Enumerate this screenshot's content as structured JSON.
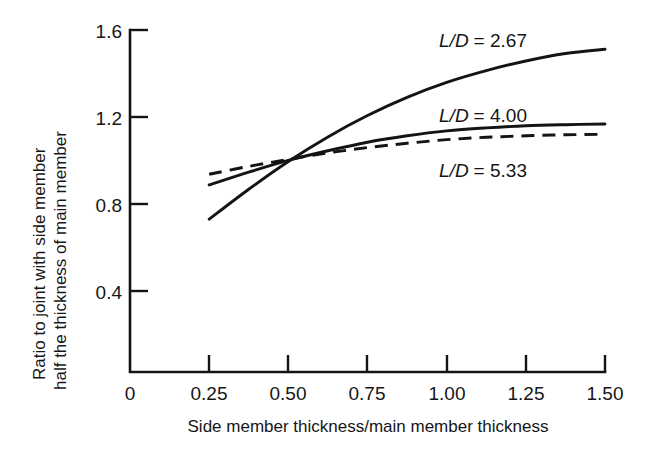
{
  "chart_data": {
    "type": "line",
    "title": "",
    "xlabel": "Side member thickness/main member thickness",
    "ylabel_line1": "Ratio to joint with side member",
    "ylabel_line2": "half the thickness of main member",
    "xlim": [
      0,
      1.5
    ],
    "ylim": [
      0,
      1.6
    ],
    "grid": false,
    "legend_position": "inline-right",
    "xticks": [
      0,
      0.25,
      0.5,
      0.75,
      1.0,
      1.25,
      1.5
    ],
    "xtick_labels": [
      "0",
      "0.25",
      "0.50",
      "0.75",
      "1.00",
      "1.25",
      "1.50"
    ],
    "yticks": [
      0.4,
      0.8,
      1.2,
      1.6
    ],
    "ytick_labels": [
      "0.4",
      "0.8",
      "1.2",
      "1.6"
    ],
    "x": [
      0.25,
      0.375,
      0.5,
      0.625,
      0.75,
      0.875,
      1.0,
      1.125,
      1.25,
      1.375,
      1.5
    ],
    "series": [
      {
        "name": "L/D = 2.67",
        "label_prefix": "L/D",
        "label_suffix": "= 2.67",
        "style": "solid",
        "values": [
          0.715,
          0.855,
          0.985,
          1.1,
          1.2,
          1.285,
          1.355,
          1.41,
          1.455,
          1.49,
          1.51
        ]
      },
      {
        "name": "L/D = 4.00",
        "label_prefix": "L/D",
        "label_suffix": "= 4.00",
        "style": "solid",
        "values": [
          0.875,
          0.935,
          0.99,
          1.035,
          1.075,
          1.105,
          1.128,
          1.142,
          1.152,
          1.157,
          1.16
        ]
      },
      {
        "name": "L/D = 5.33",
        "label_prefix": "L/D",
        "label_suffix": "= 5.33",
        "style": "dashed",
        "values": [
          0.925,
          0.962,
          0.995,
          1.025,
          1.05,
          1.07,
          1.087,
          1.098,
          1.105,
          1.11,
          1.112
        ]
      }
    ],
    "colors": {
      "ink": "#141414",
      "background": "#ffffff"
    }
  }
}
